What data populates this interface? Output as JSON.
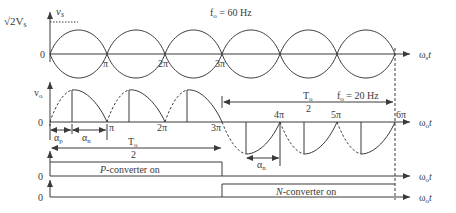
{
  "figure": {
    "top_panel": {
      "y_label": "v",
      "y_label_sub": "s",
      "peak_label": "√2V",
      "peak_label_sub": "s",
      "zero_label": "0",
      "freq_label": "f",
      "freq_label_sub": "o",
      "freq_value": " = 60 Hz",
      "x_axis_label": "ω",
      "x_axis_sub": "s",
      "x_axis_t": "t",
      "ticks": [
        "π",
        "2π",
        "3π"
      ]
    },
    "middle_panel": {
      "y_label": "v",
      "y_label_sub": "o",
      "zero_label": "0",
      "ticks_upper": [
        "π",
        "2π",
        "3π"
      ],
      "ticks_lower": [
        "4π",
        "5π",
        "6π"
      ],
      "x_axis_label": "ω",
      "x_axis_sub": "o",
      "x_axis_t": "t",
      "alpha_p": "α",
      "alpha_p_sub": "p",
      "alpha_n": "α",
      "alpha_n_sub": "n",
      "alpha_n2": "α",
      "alpha_n2_sub": "n",
      "half_period_1": "T",
      "half_period_1_sub": "o",
      "half_period_1_den": "2",
      "half_period_2": "T",
      "half_period_2_sub": "o",
      "half_period_2_den": "2",
      "freq_label": "f",
      "freq_label_sub": "o",
      "freq_value": " = 20 Hz"
    },
    "p_converter_panel": {
      "zero_label": "0",
      "label_italic": "P",
      "label_rest": "-converter on",
      "x_axis_label": "ω",
      "x_axis_sub": "o",
      "x_axis_t": "t"
    },
    "n_converter_panel": {
      "zero_label": "0",
      "label_italic": "N",
      "label_rest": "-converter on",
      "x_axis_label": "ω",
      "x_axis_sub": "o",
      "x_axis_t": "t"
    },
    "colors": {
      "line": "#3a3a3a",
      "background": "#ffffff"
    }
  }
}
